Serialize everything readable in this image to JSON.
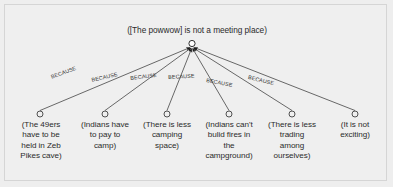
{
  "diagram": {
    "type": "argument-map",
    "background_color": "#efefef",
    "line_color": "#3a3a3a",
    "root": {
      "id": "root-claim",
      "text": "([The powwow] is not a meeting place)",
      "hub": {
        "x": 192,
        "y": 44,
        "r": 3.1
      }
    },
    "edge_label_text": "BECAUSE",
    "edges": [
      {
        "label": "BECAUSE",
        "label_x": 50,
        "label_y": 74,
        "rotate": -20
      },
      {
        "label": "BECAUSE",
        "label_x": 91,
        "label_y": 77,
        "rotate": -13
      },
      {
        "label": "BECAUSE",
        "label_x": 130,
        "label_y": 75,
        "rotate": -7
      },
      {
        "label": "BECAUSE",
        "label_x": 168,
        "label_y": 74,
        "rotate": -3
      },
      {
        "label": "BECAUSE",
        "label_x": 207,
        "label_y": 77,
        "rotate": 11
      },
      {
        "label": "BECAUSE",
        "label_x": 249,
        "label_y": 74,
        "rotate": 14
      }
    ],
    "leaves": [
      {
        "id": "leaf-1",
        "text": "(The 49ers\nhave to be\nheld in Zeb\nPikes cave)",
        "circle_x": 40,
        "circle_y": 114,
        "text_left": 8,
        "text_width": 66
      },
      {
        "id": "leaf-2",
        "text": "(Indians have\nto pay to\ncamp)",
        "circle_x": 105,
        "circle_y": 114,
        "text_left": 70,
        "text_width": 70
      },
      {
        "id": "leaf-3",
        "text": "(There is less\ncamping\nspace)",
        "circle_x": 167,
        "circle_y": 114,
        "text_left": 132,
        "text_width": 70
      },
      {
        "id": "leaf-4",
        "text": "(Indians can't\nbulid fires in\nthe\ncampground)",
        "circle_x": 229,
        "circle_y": 114,
        "text_left": 194,
        "text_width": 72
      },
      {
        "id": "leaf-5",
        "text": "(There is less\ntrading\namong\nourselves)",
        "circle_x": 292,
        "circle_y": 114,
        "text_left": 257,
        "text_width": 70
      },
      {
        "id": "leaf-6",
        "text": "(It is not\nexciting)",
        "circle_x": 355,
        "circle_y": 114,
        "text_left": 325,
        "text_width": 60
      }
    ]
  }
}
